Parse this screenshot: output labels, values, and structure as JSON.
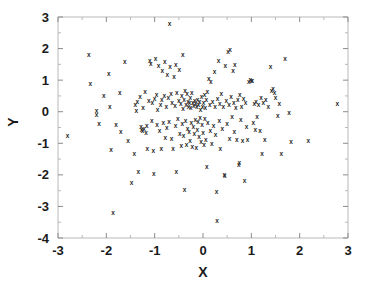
{
  "chart_data": {
    "type": "scatter",
    "title": "",
    "xlabel": "X",
    "ylabel": "Y",
    "xlim": [
      -3,
      3
    ],
    "ylim": [
      -4,
      3
    ],
    "xticks": [
      -3,
      -2,
      -1,
      0,
      1,
      2,
      3
    ],
    "yticks": [
      -4,
      -3,
      -2,
      -1,
      0,
      1,
      2,
      3
    ],
    "xtick_labels": [
      "-3",
      "-2",
      "-1",
      "0",
      "1",
      "2",
      "3"
    ],
    "ytick_labels": [
      "-4",
      "-3",
      "-2",
      "-1",
      "0",
      "1",
      "2",
      "3"
    ],
    "minor_tick_step": 0.5,
    "grid": false,
    "legend": null,
    "marker": "x",
    "marker_color": "#2b2b2b",
    "frame_color": "#b9b9b9",
    "background": "#ffffff",
    "n_points": 218,
    "points": [
      [
        -2.8,
        -0.75
      ],
      [
        -2.36,
        1.8
      ],
      [
        -2.33,
        0.88
      ],
      [
        -2.2,
        0.05
      ],
      [
        -2.2,
        -0.1
      ],
      [
        -2.15,
        -0.38
      ],
      [
        -2.05,
        0.52
      ],
      [
        -1.95,
        1.22
      ],
      [
        -1.93,
        0.18
      ],
      [
        -1.9,
        -1.2
      ],
      [
        -1.86,
        -3.2
      ],
      [
        -1.8,
        -0.42
      ],
      [
        -1.72,
        0.62
      ],
      [
        -1.7,
        -0.62
      ],
      [
        -1.62,
        1.58
      ],
      [
        -1.55,
        -0.92
      ],
      [
        -1.48,
        -2.25
      ],
      [
        -1.42,
        -1.32
      ],
      [
        -1.4,
        0.22
      ],
      [
        -1.38,
        0.05
      ],
      [
        -1.36,
        0.32
      ],
      [
        -1.34,
        -1.9
      ],
      [
        -1.3,
        0.48
      ],
      [
        -1.28,
        -0.48
      ],
      [
        -1.27,
        -0.55
      ],
      [
        -1.25,
        -0.6
      ],
      [
        -1.24,
        0.12
      ],
      [
        -1.22,
        -0.52
      ],
      [
        -1.2,
        0.65
      ],
      [
        -1.18,
        -0.65
      ],
      [
        -1.16,
        -0.45
      ],
      [
        -1.15,
        -1.18
      ],
      [
        -1.12,
        0.35
      ],
      [
        -1.1,
        1.62
      ],
      [
        -1.08,
        1.52
      ],
      [
        -1.06,
        -0.28
      ],
      [
        -1.05,
        0.28
      ],
      [
        -1.03,
        -1.22
      ],
      [
        -1.02,
        -1.95
      ],
      [
        -1.0,
        0.42
      ],
      [
        -0.98,
        1.7
      ],
      [
        -0.96,
        0.55
      ],
      [
        -0.95,
        -0.4
      ],
      [
        -0.94,
        0.08
      ],
      [
        -0.92,
        1.45
      ],
      [
        -0.9,
        -0.58
      ],
      [
        -0.88,
        0.22
      ],
      [
        -0.86,
        -1.15
      ],
      [
        -0.85,
        0.38
      ],
      [
        -0.84,
        1.3
      ],
      [
        -0.82,
        -0.35
      ],
      [
        -0.8,
        0.5
      ],
      [
        -0.79,
        1.58
      ],
      [
        -0.78,
        -0.82
      ],
      [
        -0.76,
        0.15
      ],
      [
        -0.75,
        -0.5
      ],
      [
        -0.74,
        1.18
      ],
      [
        -0.72,
        0.45
      ],
      [
        -0.7,
        -0.3
      ],
      [
        -0.69,
        2.78
      ],
      [
        -0.68,
        1.42
      ],
      [
        -0.66,
        0.58
      ],
      [
        -0.65,
        -0.85
      ],
      [
        -0.64,
        0.3
      ],
      [
        -0.62,
        -1.18
      ],
      [
        -0.6,
        1.12
      ],
      [
        -0.58,
        0.2
      ],
      [
        -0.57,
        -0.45
      ],
      [
        -0.56,
        1.48
      ],
      [
        -0.55,
        -1.88
      ],
      [
        -0.54,
        0.62
      ],
      [
        -0.52,
        -0.22
      ],
      [
        -0.5,
        0.35
      ],
      [
        -0.49,
        1.35
      ],
      [
        -0.48,
        -0.68
      ],
      [
        -0.46,
        0.25
      ],
      [
        -0.45,
        -1.08
      ],
      [
        -0.44,
        0.52
      ],
      [
        -0.43,
        -0.38
      ],
      [
        -0.42,
        1.82
      ],
      [
        -0.41,
        0.1
      ],
      [
        -0.4,
        -0.75
      ],
      [
        -0.39,
        0.4
      ],
      [
        -0.38,
        -2.45
      ],
      [
        -0.37,
        0.68
      ],
      [
        -0.36,
        -0.28
      ],
      [
        -0.35,
        0.22
      ],
      [
        -0.34,
        -1.05
      ],
      [
        -0.33,
        0.58
      ],
      [
        -0.32,
        -0.52
      ],
      [
        -0.31,
        0.32
      ],
      [
        -0.3,
        0.18
      ],
      [
        -0.29,
        -0.62
      ],
      [
        -0.28,
        0.28
      ],
      [
        -0.27,
        -0.92
      ],
      [
        -0.26,
        0.45
      ],
      [
        -0.25,
        0.12
      ],
      [
        -0.24,
        -0.35
      ],
      [
        -0.23,
        0.62
      ],
      [
        -0.22,
        -1.1
      ],
      [
        -0.21,
        0.3
      ],
      [
        -0.2,
        -0.48
      ],
      [
        -0.19,
        0.2
      ],
      [
        -0.18,
        -0.7
      ],
      [
        -0.17,
        0.35
      ],
      [
        -0.16,
        -0.25
      ],
      [
        -0.15,
        0.25
      ],
      [
        -0.14,
        -1.12
      ],
      [
        -0.13,
        0.15
      ],
      [
        -0.12,
        -0.55
      ],
      [
        -0.11,
        0.4
      ],
      [
        -0.1,
        -0.3
      ],
      [
        -0.09,
        0.22
      ],
      [
        -0.08,
        -0.8
      ],
      [
        -0.07,
        0.32
      ],
      [
        -0.06,
        -0.18
      ],
      [
        -0.05,
        0.08
      ],
      [
        -0.04,
        -0.95
      ],
      [
        -0.03,
        0.48
      ],
      [
        -0.02,
        -0.42
      ],
      [
        -0.01,
        0.18
      ],
      [
        0.0,
        -0.65
      ],
      [
        0.01,
        0.28
      ],
      [
        0.02,
        -1.05
      ],
      [
        0.03,
        0.55
      ],
      [
        0.04,
        -0.22
      ],
      [
        0.05,
        0.12
      ],
      [
        0.06,
        -0.88
      ],
      [
        0.07,
        0.38
      ],
      [
        0.08,
        -1.72
      ],
      [
        0.09,
        0.65
      ],
      [
        0.1,
        -0.35
      ],
      [
        0.12,
        1.05
      ],
      [
        0.14,
        0.22
      ],
      [
        0.15,
        -0.58
      ],
      [
        0.16,
        0.95
      ],
      [
        0.18,
        -1.02
      ],
      [
        0.2,
        0.32
      ],
      [
        0.22,
        -0.45
      ],
      [
        0.24,
        1.28
      ],
      [
        0.25,
        0.18
      ],
      [
        0.26,
        -0.72
      ],
      [
        0.28,
        -2.52
      ],
      [
        0.29,
        -3.45
      ],
      [
        0.3,
        0.42
      ],
      [
        0.32,
        1.62
      ],
      [
        0.34,
        -0.28
      ],
      [
        0.35,
        0.25
      ],
      [
        0.36,
        -1.15
      ],
      [
        0.38,
        0.58
      ],
      [
        0.4,
        -0.52
      ],
      [
        0.42,
        0.15
      ],
      [
        0.44,
        -1.98
      ],
      [
        0.45,
        -2.02
      ],
      [
        0.46,
        1.45
      ],
      [
        0.48,
        0.35
      ],
      [
        0.5,
        -0.38
      ],
      [
        0.52,
        1.92
      ],
      [
        0.54,
        0.22
      ],
      [
        0.55,
        -0.85
      ],
      [
        0.56,
        1.98
      ],
      [
        0.58,
        0.48
      ],
      [
        0.6,
        -0.15
      ],
      [
        0.62,
        1.32
      ],
      [
        0.64,
        0.28
      ],
      [
        0.65,
        -0.62
      ],
      [
        0.66,
        1.48
      ],
      [
        0.68,
        0.12
      ],
      [
        0.7,
        -0.88
      ],
      [
        0.72,
        0.38
      ],
      [
        0.74,
        -1.68
      ],
      [
        0.75,
        -1.62
      ],
      [
        0.76,
        0.55
      ],
      [
        0.78,
        -0.25
      ],
      [
        0.8,
        0.18
      ],
      [
        0.82,
        -0.92
      ],
      [
        0.84,
        0.42
      ],
      [
        0.86,
        -2.18
      ],
      [
        0.88,
        0.3
      ],
      [
        0.9,
        -0.48
      ],
      [
        0.92,
        -0.88
      ],
      [
        0.95,
        0.95
      ],
      [
        0.98,
        1.02
      ],
      [
        1.0,
        0.98
      ],
      [
        1.02,
        1.0
      ],
      [
        1.04,
        -0.35
      ],
      [
        1.06,
        0.25
      ],
      [
        1.08,
        -0.55
      ],
      [
        1.1,
        0.32
      ],
      [
        1.12,
        -0.15
      ],
      [
        1.15,
        0.22
      ],
      [
        1.18,
        -0.58
      ],
      [
        1.2,
        0.45
      ],
      [
        1.22,
        -1.32
      ],
      [
        1.25,
        0.28
      ],
      [
        1.28,
        -0.88
      ],
      [
        1.3,
        0.38
      ],
      [
        1.35,
        0.15
      ],
      [
        1.4,
        1.42
      ],
      [
        1.42,
        0.68
      ],
      [
        1.45,
        0.72
      ],
      [
        1.48,
        0.62
      ],
      [
        1.5,
        0.45
      ],
      [
        1.55,
        -0.12
      ],
      [
        1.58,
        0.25
      ],
      [
        1.62,
        -1.32
      ],
      [
        1.7,
        1.7
      ],
      [
        1.78,
        -0.02
      ],
      [
        1.82,
        -0.95
      ],
      [
        2.18,
        -0.9
      ],
      [
        2.78,
        0.25
      ]
    ]
  }
}
